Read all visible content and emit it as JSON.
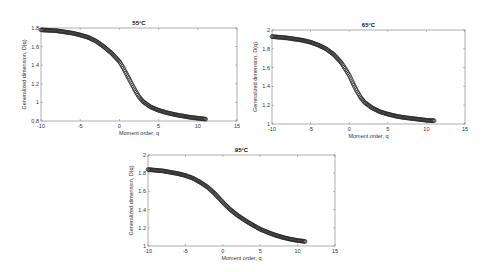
{
  "chart_data": [
    {
      "type": "scatter",
      "title": "55°C",
      "xlabel": "Moment order, q",
      "ylabel": "Generalized dimension, D(q)",
      "xlim": [
        -10,
        15
      ],
      "ylim": [
        0.8,
        1.8
      ],
      "xticks": [
        "-10",
        "-5",
        "0",
        "5",
        "10",
        "15"
      ],
      "yticks": [
        "0.8",
        "1",
        "1.2",
        "1.4",
        "1.6",
        "1.8"
      ],
      "grid": false,
      "x": [
        -10,
        -8,
        -6,
        -5,
        -4,
        -3,
        -2,
        -1,
        0,
        0.5,
        1,
        1.5,
        2,
        2.5,
        3,
        4,
        5,
        6,
        7,
        8,
        9,
        10,
        11
      ],
      "y": [
        1.78,
        1.77,
        1.745,
        1.725,
        1.7,
        1.66,
        1.6,
        1.53,
        1.44,
        1.37,
        1.29,
        1.21,
        1.13,
        1.06,
        1.01,
        0.95,
        0.915,
        0.89,
        0.87,
        0.855,
        0.84,
        0.83,
        0.82
      ]
    },
    {
      "type": "scatter",
      "title": "65°C",
      "xlabel": "Moment order, q",
      "ylabel": "Generalized dimension, D(q)",
      "xlim": [
        -10,
        15
      ],
      "ylim": [
        1,
        2
      ],
      "xticks": [
        "-10",
        "-5",
        "0",
        "5",
        "10",
        "15"
      ],
      "yticks": [
        "1",
        "1.2",
        "1.4",
        "1.6",
        "1.8",
        "2"
      ],
      "grid": false,
      "x": [
        -10,
        -8,
        -6,
        -5,
        -4,
        -3,
        -2,
        -1,
        0,
        0.5,
        1,
        1.5,
        2,
        3,
        4,
        5,
        6,
        7,
        8,
        9,
        10,
        11
      ],
      "y": [
        1.93,
        1.915,
        1.89,
        1.87,
        1.84,
        1.8,
        1.74,
        1.65,
        1.52,
        1.43,
        1.35,
        1.28,
        1.23,
        1.17,
        1.13,
        1.105,
        1.085,
        1.07,
        1.06,
        1.05,
        1.04,
        1.035
      ]
    },
    {
      "type": "scatter",
      "title": "95°C",
      "xlabel": "Moment order, q",
      "ylabel": "Generalized dimension, D(q)",
      "xlim": [
        -10,
        15
      ],
      "ylim": [
        1,
        2
      ],
      "xticks": [
        "-10",
        "-5",
        "0",
        "5",
        "10",
        "15"
      ],
      "yticks": [
        "1",
        "1.2",
        "1.4",
        "1.6",
        "1.8",
        "2"
      ],
      "grid": false,
      "x": [
        -10,
        -8,
        -6,
        -5,
        -4,
        -3,
        -2,
        -1,
        0,
        1,
        2,
        3,
        4,
        5,
        6,
        7,
        8,
        9,
        10,
        11
      ],
      "y": [
        1.84,
        1.825,
        1.795,
        1.775,
        1.745,
        1.7,
        1.645,
        1.57,
        1.48,
        1.4,
        1.335,
        1.28,
        1.23,
        1.185,
        1.15,
        1.12,
        1.095,
        1.075,
        1.06,
        1.05
      ]
    }
  ]
}
